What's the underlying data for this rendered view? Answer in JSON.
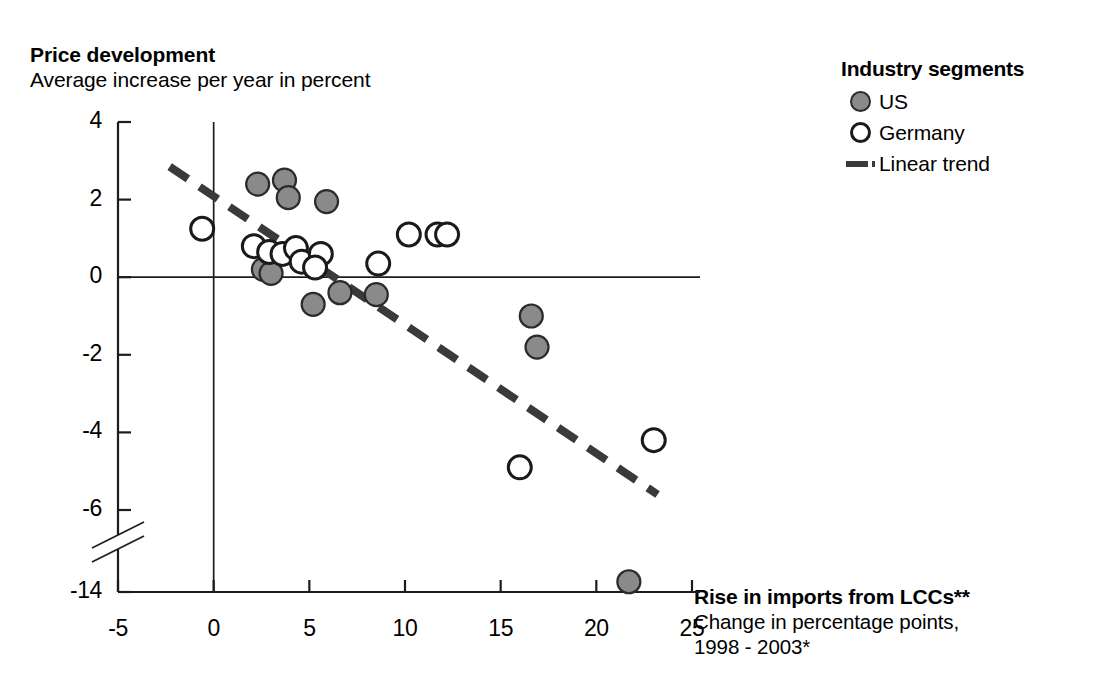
{
  "header": {
    "title": "Price development",
    "subtitle": "Average increase per year in percent"
  },
  "xcaption": {
    "title": "Rise in imports from LCCs**",
    "line1": "Change in percentage points,",
    "line2": "1998 - 2003*"
  },
  "legend": {
    "title": "Industry segments",
    "items": [
      {
        "label": "US",
        "marker": "filled-circle",
        "color": "#8a8a8a"
      },
      {
        "label": "Germany",
        "marker": "open-circle",
        "color": "#ffffff"
      },
      {
        "label": "Linear trend",
        "marker": "dashed-line",
        "color": "#3a3a3a"
      }
    ]
  },
  "chart_data": {
    "type": "scatter",
    "title": "Price development",
    "subtitle": "Average increase per year in percent",
    "xlabel": "Rise in imports from LCCs** - Change in percentage points, 1998 - 2003*",
    "ylabel": "Average increase per year in percent",
    "xlim": [
      -5,
      25
    ],
    "ylim": [
      -14,
      4
    ],
    "grid": false,
    "legend_position": "top-right",
    "axis_break": {
      "axis": "y",
      "between": [
        -6,
        -14
      ],
      "style": "double-slash"
    },
    "zero_lines": {
      "x": 0,
      "y": 0
    },
    "xticks": [
      -5,
      0,
      5,
      10,
      15,
      20,
      25
    ],
    "yticks": [
      4,
      2,
      0,
      -2,
      -4,
      -6,
      -14
    ],
    "ytick_labels": [
      "4",
      "2",
      "0",
      "-2",
      "-4",
      "-6",
      "-14"
    ],
    "xtick_labels": [
      "-5",
      "0",
      "5",
      "10",
      "15",
      "20",
      "25"
    ],
    "series": [
      {
        "name": "US",
        "marker": "filled-circle",
        "color": "#8a8a8a",
        "points": [
          {
            "x": 2.3,
            "y": 2.4
          },
          {
            "x": 3.7,
            "y": 2.5
          },
          {
            "x": 3.9,
            "y": 2.05
          },
          {
            "x": 5.9,
            "y": 1.95
          },
          {
            "x": 2.6,
            "y": 0.2
          },
          {
            "x": 3.0,
            "y": 0.1
          },
          {
            "x": 5.2,
            "y": -0.7
          },
          {
            "x": 6.6,
            "y": -0.4
          },
          {
            "x": 8.5,
            "y": -0.45
          },
          {
            "x": 16.6,
            "y": -1.0
          },
          {
            "x": 16.9,
            "y": -1.8
          },
          {
            "x": 21.7,
            "y": -13.0
          }
        ]
      },
      {
        "name": "Germany",
        "marker": "open-circle",
        "color": "#ffffff",
        "points": [
          {
            "x": -0.6,
            "y": 1.25
          },
          {
            "x": 2.1,
            "y": 0.8
          },
          {
            "x": 2.9,
            "y": 0.65
          },
          {
            "x": 3.6,
            "y": 0.6
          },
          {
            "x": 4.3,
            "y": 0.75
          },
          {
            "x": 4.6,
            "y": 0.4
          },
          {
            "x": 5.6,
            "y": 0.6
          },
          {
            "x": 5.3,
            "y": 0.25
          },
          {
            "x": 8.6,
            "y": 0.35
          },
          {
            "x": 10.2,
            "y": 1.1
          },
          {
            "x": 11.7,
            "y": 1.1
          },
          {
            "x": 12.2,
            "y": 1.1
          },
          {
            "x": 16.0,
            "y": -4.9
          },
          {
            "x": 23.0,
            "y": -4.2
          }
        ]
      }
    ],
    "trend": {
      "name": "Linear trend",
      "style": "dashed",
      "color": "#3a3a3a",
      "x_start": -2.3,
      "y_start": 2.85,
      "x_end": 23.2,
      "y_end": -5.6
    }
  }
}
